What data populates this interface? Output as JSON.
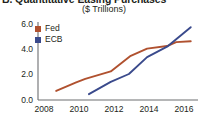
{
  "figure": {
    "title": "B.  Quantitative Easing Purchases",
    "subtitle": "($ Trillions)"
  },
  "legend": {
    "items": [
      {
        "label": "Fed",
        "color": "#B0512F"
      },
      {
        "label": "ECB",
        "color": "#3A4A8C"
      }
    ]
  },
  "axes": {
    "y_ticks": [
      "0.0",
      "2.0",
      "4.0",
      "6.0"
    ],
    "x_ticks": [
      "2008",
      "2010",
      "2012",
      "2014",
      "2016"
    ]
  },
  "chart_data": {
    "type": "line",
    "title": "B.  Quantitative Easing Purchases",
    "subtitle": "($ Trillions)",
    "xlabel": "",
    "ylabel": "$ Trillions",
    "xlim": [
      2008,
      2016.8
    ],
    "ylim": [
      0.0,
      6.0
    ],
    "yticks": [
      0.0,
      2.0,
      4.0,
      6.0
    ],
    "xticks": [
      2008,
      2010,
      2012,
      2014,
      2016
    ],
    "grid": false,
    "legend_position": "inside-top-left",
    "series": [
      {
        "name": "Fed",
        "color": "#B0512F",
        "points": [
          [
            2009.0,
            0.7
          ],
          [
            2010.1,
            1.35
          ],
          [
            2010.6,
            1.62
          ],
          [
            2012.0,
            2.2
          ],
          [
            2013.1,
            3.4
          ],
          [
            2014.0,
            3.95
          ],
          [
            2015.1,
            4.15
          ],
          [
            2015.6,
            4.45
          ],
          [
            2016.4,
            4.52
          ]
        ]
      },
      {
        "name": "ECB",
        "color": "#3A4A8C",
        "points": [
          [
            2010.8,
            0.45
          ],
          [
            2012.0,
            1.4
          ],
          [
            2013.0,
            2.0
          ],
          [
            2014.0,
            3.3
          ],
          [
            2015.1,
            4.1
          ],
          [
            2016.4,
            5.6
          ]
        ]
      }
    ]
  }
}
